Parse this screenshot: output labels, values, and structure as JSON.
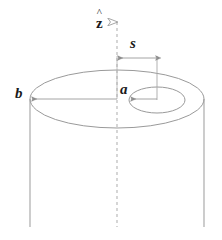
{
  "figure": {
    "background_color": "#ffffff",
    "line_color": "#9a9a9a",
    "label_color": "#1a1a1a",
    "width": 222,
    "height": 240
  },
  "labels": {
    "axis": "z",
    "axis_accent": "^",
    "source_distance": "s",
    "outer_radius": "b",
    "inner_radius": "a"
  },
  "geometry": {
    "axis": {
      "x": 117,
      "top_y": 15,
      "bottom_y": 227,
      "style": "dashed",
      "arrowhead": "up"
    },
    "outer_ellipse": {
      "cx": 117,
      "cy": 99,
      "rx": 87,
      "ry": 29
    },
    "inner_ellipse": {
      "cx": 157,
      "cy": 100,
      "rx": 28,
      "ry": 13
    },
    "cylinder_walls": {
      "left_x": 30,
      "right_x": 204,
      "top_y": 99,
      "bottom_y": 227
    },
    "arrow_s": {
      "x1": 117,
      "x2": 157,
      "y": 58,
      "heads": "both"
    },
    "arrow_b": {
      "x1": 117,
      "x2": 30,
      "y": 99,
      "heads": "left"
    },
    "arrow_a": {
      "x1": 157,
      "x2": 129,
      "y": 99,
      "heads": "left"
    },
    "leader_lines": [
      {
        "x": 117,
        "y1": 58,
        "y2": 99
      },
      {
        "x": 157,
        "y1": 58,
        "y2": 99
      }
    ]
  }
}
